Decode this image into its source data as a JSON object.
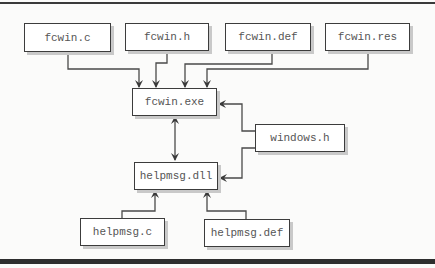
{
  "diagram": {
    "nodes": {
      "fcwin_c": "fcwin.c",
      "fcwin_h": "fcwin.h",
      "fcwin_def": "fcwin.def",
      "fcwin_res": "fcwin.res",
      "fcwin_exe": "fcwin.exe",
      "windows_h": "windows.h",
      "helpmsg_dll": "helpmsg.dll",
      "helpmsg_c": "helpmsg.c",
      "helpmsg_def": "helpmsg.def"
    },
    "edges": [
      {
        "from": "fcwin.c",
        "to": "fcwin.exe"
      },
      {
        "from": "fcwin.h",
        "to": "fcwin.exe"
      },
      {
        "from": "fcwin.def",
        "to": "fcwin.exe"
      },
      {
        "from": "fcwin.res",
        "to": "fcwin.exe"
      },
      {
        "from": "windows.h",
        "to": "fcwin.exe"
      },
      {
        "from": "windows.h",
        "to": "helpmsg.dll"
      },
      {
        "from": "fcwin.exe",
        "to": "helpmsg.dll",
        "bidirectional": true
      },
      {
        "from": "helpmsg.c",
        "to": "helpmsg.dll"
      },
      {
        "from": "helpmsg.def",
        "to": "helpmsg.dll"
      }
    ]
  }
}
